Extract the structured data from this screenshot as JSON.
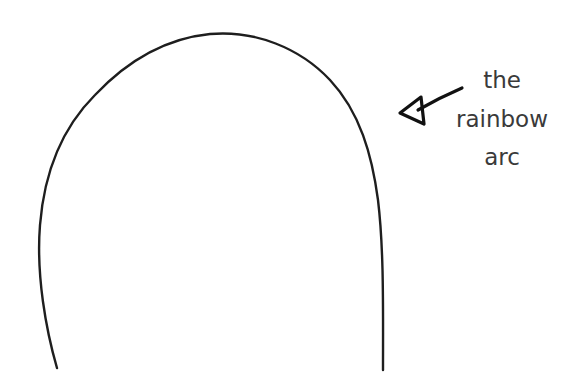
{
  "diagram": {
    "type": "annotated-sketch",
    "annotation": {
      "lines": [
        "the",
        "rainbow",
        "arc"
      ],
      "points_to": "arc-curve"
    },
    "colors": {
      "stroke": "#1e1e1e",
      "text": "#3a3a3a",
      "background": "#ffffff"
    }
  }
}
